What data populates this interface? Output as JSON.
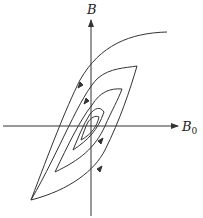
{
  "diagram": {
    "type": "hysteresis-loops",
    "y_axis_label": "B",
    "x_axis_label": "B",
    "x_axis_subscript": "0",
    "loop_count": 4,
    "stroke_color": "#333333"
  }
}
